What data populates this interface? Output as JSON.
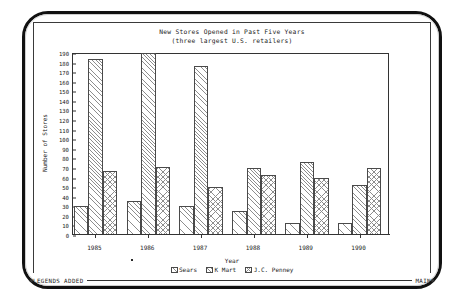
{
  "terminal": {
    "status_left": "LEGENDS ADDED",
    "status_right": "MAIN"
  },
  "chart_data": {
    "type": "bar",
    "title": "New Stores Opened in Past Five Years",
    "subtitle": "(three largest U.S. retailers)",
    "xlabel": "Year",
    "ylabel": "Number of Stores",
    "categories": [
      "1985",
      "1986",
      "1987",
      "1988",
      "1989",
      "1990"
    ],
    "series": [
      {
        "name": "Sears",
        "values": [
          30,
          36,
          30,
          25,
          13,
          13
        ]
      },
      {
        "name": "K Mart",
        "values": [
          184,
          190,
          176,
          70,
          76,
          52
        ]
      },
      {
        "name": "J.C. Penney",
        "values": [
          67,
          71,
          50,
          63,
          60,
          70
        ]
      }
    ],
    "ylim": [
      0,
      190
    ],
    "ytick_step": 10,
    "yticks": [
      0,
      10,
      20,
      30,
      40,
      50,
      60,
      70,
      80,
      90,
      100,
      110,
      120,
      130,
      140,
      150,
      160,
      170,
      180,
      190
    ],
    "grid": false,
    "legend_position": "bottom"
  }
}
